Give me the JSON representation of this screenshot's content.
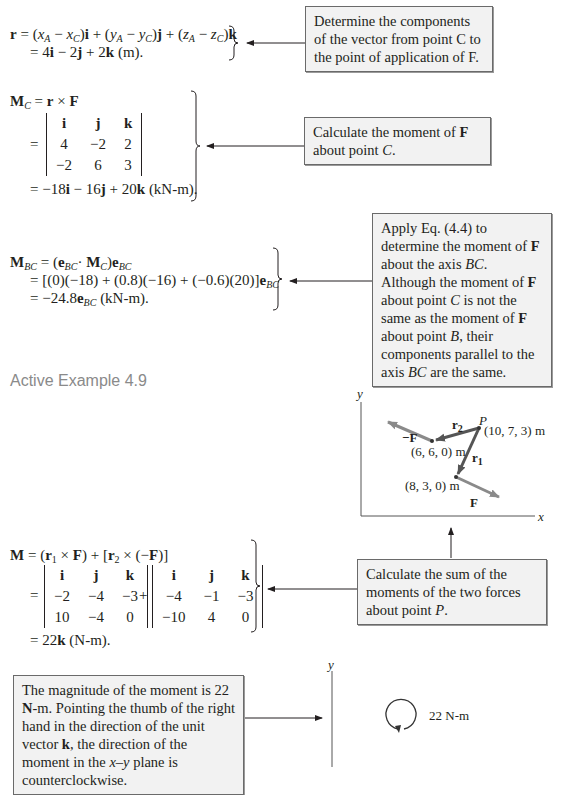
{
  "step1": {
    "equation_line1": "r = (x_A − x_C)i + (y_A − y_C)j + (z_A − z_C)k",
    "equation_line2": "= 4i − 2j + 2k (m).",
    "note": "Determine the components of the vector from point C to the point of application of F."
  },
  "step2": {
    "equation_line1": "M_C = r × F",
    "matrix": [
      [
        "i",
        "j",
        "k"
      ],
      [
        "4",
        "−2",
        "2"
      ],
      [
        "−2",
        "6",
        "3"
      ]
    ],
    "result": "= −18i − 16j + 20k (kN-m).",
    "note": "Calculate the moment of F about point C."
  },
  "step3": {
    "equation_line1": "M_BC = (e_BC · M_C)e_BC",
    "equation_line2": "= [(0)(−18) + (0.8)(−16) + (−0.6)(20)]e_BC",
    "equation_line3": "= −24.8e_BC (kN-m).",
    "note": "Apply Eq. (4.4) to determine the moment of F about the axis BC. Although the moment of F about point C is not the same as the moment of F about point B, their components parallel to the axis BC are the same."
  },
  "section_heading": "Active Example 4.9",
  "diagram": {
    "axis_x": "x",
    "axis_y": "y",
    "point_P_label": "P",
    "point_P_coords": "(10, 7, 3) m",
    "point_a_coords": "(6, 6, 0) m",
    "point_b_coords": "(8, 3, 0) m",
    "label_r1": "r1",
    "label_r2": "r2",
    "label_F": "F",
    "label_negF": "−F"
  },
  "step4": {
    "equation_line1": "M = (r1 × F) + [r2 × (−F)]",
    "matrix1": [
      [
        "i",
        "j",
        "k"
      ],
      [
        "−2",
        "−4",
        "−3"
      ],
      [
        "10",
        "−4",
        "0"
      ]
    ],
    "matrix2": [
      [
        "i",
        "j",
        "k"
      ],
      [
        "−4",
        "−1",
        "−3"
      ],
      [
        "−10",
        "4",
        "0"
      ]
    ],
    "result": "= 22k (N-m).",
    "note": "Calculate the sum of the moments of the two forces about point P."
  },
  "step5": {
    "note": "The magnitude of the moment is 22 N-m. Pointing the thumb of the right hand in the direction of the unit vector k, the direction of the moment in the x–y plane is counterclockwise.",
    "axis_y": "y",
    "moment_label": "22 N-m"
  }
}
